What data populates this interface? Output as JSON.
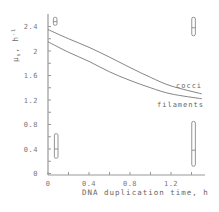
{
  "chart_data": {
    "type": "line",
    "title": "",
    "xlabel": "DNA duplication time, h",
    "ylabel": "μ_s, h⁻¹",
    "xlim": [
      0,
      1.45
    ],
    "ylim": [
      0,
      2.55
    ],
    "x_ticks": [
      0,
      0.2,
      0.4,
      0.6,
      0.8,
      1.0,
      1.2,
      1.4
    ],
    "x_tick_labels": [
      "0",
      "0.4",
      "0.8",
      "1.2"
    ],
    "x_tick_label_values": [
      0,
      0.4,
      0.8,
      1.2
    ],
    "y_ticks": [
      0,
      0.2,
      0.4,
      0.6,
      0.8,
      1.0,
      1.2,
      1.4,
      1.6,
      1.8,
      2.0,
      2.2,
      2.4
    ],
    "y_tick_labels": [
      "0",
      "0.4",
      "0.8",
      "1.2",
      "1.6",
      "2",
      "2.4"
    ],
    "y_tick_label_values": [
      0,
      0.4,
      0.8,
      1.2,
      1.6,
      2.0,
      2.4
    ],
    "grid": false,
    "series": [
      {
        "name": "cocci",
        "x": [
          0,
          0.2,
          0.4,
          0.6,
          0.8,
          1.0,
          1.2,
          1.5
        ],
        "y": [
          2.35,
          2.2,
          2.06,
          1.9,
          1.73,
          1.57,
          1.43,
          1.3
        ]
      },
      {
        "name": "filaments",
        "x": [
          0,
          0.2,
          0.4,
          0.6,
          0.8,
          1.0,
          1.2,
          1.5
        ],
        "y": [
          2.15,
          1.98,
          1.83,
          1.66,
          1.52,
          1.4,
          1.3,
          1.22
        ]
      }
    ],
    "error_bars": [
      {
        "x": 0.08,
        "y_low": 0.25,
        "y_high": 0.65,
        "y_mid": 0.4
      },
      {
        "x": 1.42,
        "y_low": 0.12,
        "y_high": 0.85,
        "y_mid": 0.38
      },
      {
        "x": 0.07,
        "y_low": 2.42,
        "y_high": 2.55,
        "y_mid": 2.48
      },
      {
        "x": 1.42,
        "y_low": 2.25,
        "y_high": 2.55,
        "y_mid": 2.38
      }
    ],
    "annotations": [
      "cocci",
      "filaments"
    ]
  },
  "labels": {
    "ylabel_main": "μ",
    "ylabel_sub": "s",
    "ylabel_unit": ", h",
    "ylabel_sup": "-1",
    "xlabel": "DNA duplication time, h",
    "cocci": "cocci",
    "filaments": "filaments"
  }
}
